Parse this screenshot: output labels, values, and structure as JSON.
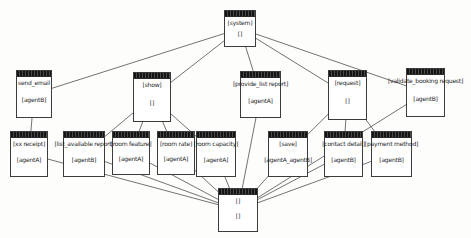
{
  "diagram": {
    "background_color": "#fdfdfc",
    "line_color": "#4f4f4f",
    "titlebar_color": "#141414",
    "box_border_color": "#3c3c3c",
    "nodes": [
      {
        "id": "system",
        "name": "[system]",
        "label2": "[]",
        "x": 224,
        "y": 10,
        "w": 32,
        "h": 37
      },
      {
        "id": "send-email",
        "name": "send_email",
        "label2": "[agentB]",
        "x": 16,
        "y": 70,
        "w": 36,
        "h": 48
      },
      {
        "id": "show",
        "name": "[show]",
        "label2": "[]",
        "x": 133,
        "y": 72,
        "w": 38,
        "h": 50
      },
      {
        "id": "provide-list-report",
        "name": "[provide_list report]",
        "label2": "[agentA]",
        "x": 240,
        "y": 71,
        "w": 41,
        "h": 47
      },
      {
        "id": "request",
        "name": "[request]",
        "label2": "[]",
        "x": 328,
        "y": 70,
        "w": 39,
        "h": 50
      },
      {
        "id": "validate-booking-request",
        "name": "[validate_booking request]",
        "label2": "[agentB]",
        "x": 406,
        "y": 68,
        "w": 39,
        "h": 49
      },
      {
        "id": "xx-receipt",
        "name": "[xx receipt]",
        "label2": "[agentA]",
        "x": 10,
        "y": 131,
        "w": 38,
        "h": 46
      },
      {
        "id": "list-available-report",
        "name": "[list_available report]",
        "label2": "[agentB]",
        "x": 63,
        "y": 131,
        "w": 42,
        "h": 46
      },
      {
        "id": "room-feature",
        "name": "[room feature]",
        "label2": "[agentA]",
        "x": 112,
        "y": 131,
        "w": 38,
        "h": 44
      },
      {
        "id": "room-rate",
        "name": "[room rate]",
        "label2": "[agentA]",
        "x": 157,
        "y": 131,
        "w": 38,
        "h": 44
      },
      {
        "id": "room-capacity",
        "name": "[room capacity]",
        "label2": "[agentA]",
        "x": 196,
        "y": 131,
        "w": 40,
        "h": 46
      },
      {
        "id": "save",
        "name": "[save]",
        "label2": "[agentA_agentB]",
        "x": 268,
        "y": 131,
        "w": 40,
        "h": 46
      },
      {
        "id": "contact-detail",
        "name": "[contact detail]",
        "label2": "[agentB]",
        "x": 324,
        "y": 131,
        "w": 39,
        "h": 46
      },
      {
        "id": "payment-method",
        "name": "[payment method]",
        "label2": "[agentB]",
        "x": 371,
        "y": 131,
        "w": 41,
        "h": 46
      },
      {
        "id": "end",
        "name": "[]",
        "label2": "[]",
        "x": 218,
        "y": 188,
        "w": 40,
        "h": 44
      }
    ],
    "edges": [
      [
        "system",
        "send-email"
      ],
      [
        "system",
        "show"
      ],
      [
        "system",
        "provide-list-report"
      ],
      [
        "system",
        "request"
      ],
      [
        "system",
        "validate-booking-request"
      ],
      [
        "send-email",
        "xx-receipt"
      ],
      [
        "show",
        "list-available-report"
      ],
      [
        "show",
        "room-feature"
      ],
      [
        "show",
        "room-rate"
      ],
      [
        "show",
        "room-capacity"
      ],
      [
        "request",
        "save"
      ],
      [
        "request",
        "contact-detail"
      ],
      [
        "request",
        "payment-method"
      ],
      [
        "xx-receipt",
        "end"
      ],
      [
        "list-available-report",
        "end"
      ],
      [
        "room-feature",
        "end"
      ],
      [
        "room-rate",
        "end"
      ],
      [
        "room-capacity",
        "end"
      ],
      [
        "provide-list-report",
        "end"
      ],
      [
        "save",
        "end"
      ],
      [
        "contact-detail",
        "end"
      ],
      [
        "payment-method",
        "end"
      ],
      [
        "validate-booking-request",
        "end"
      ]
    ]
  }
}
